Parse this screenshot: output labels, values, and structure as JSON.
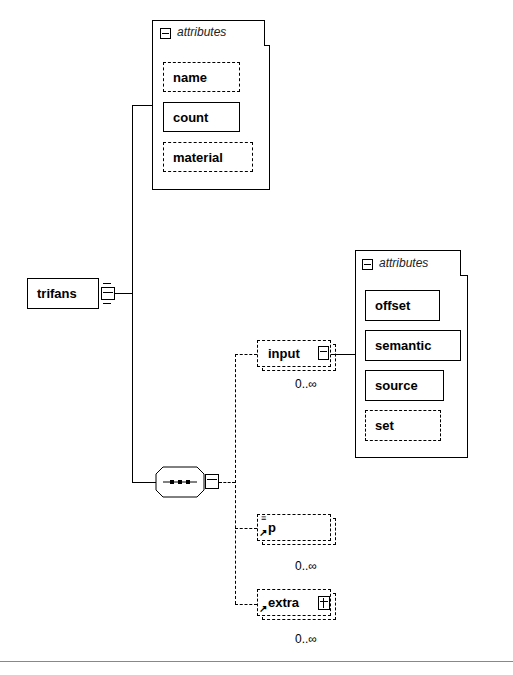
{
  "diagram": {
    "root": {
      "label": "trifans",
      "expander": "minus"
    },
    "root_attributes": {
      "title": "attributes",
      "items": [
        {
          "label": "name",
          "optional": true
        },
        {
          "label": "count",
          "optional": false
        },
        {
          "label": "material",
          "optional": true
        }
      ]
    },
    "sequence": {
      "symbol": "sequence-compositor",
      "expander": "minus"
    },
    "children": [
      {
        "label": "input",
        "optional": true,
        "cardinality": "0..∞",
        "expander": "minus"
      },
      {
        "label": "p",
        "optional": true,
        "cardinality": "0..∞",
        "expander": null
      },
      {
        "label": "extra",
        "optional": true,
        "cardinality": "0..∞",
        "expander": "plus"
      }
    ],
    "input_attributes": {
      "title": "attributes",
      "items": [
        {
          "label": "offset",
          "optional": false
        },
        {
          "label": "semantic",
          "optional": false
        },
        {
          "label": "source",
          "optional": false
        },
        {
          "label": "set",
          "optional": true
        }
      ]
    }
  }
}
